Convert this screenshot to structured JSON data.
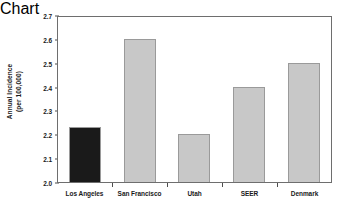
{
  "chart_data": {
    "type": "bar",
    "title": "",
    "xlabel": "",
    "ylabel": "Annual Incidence (per 100,000)",
    "ylabel_lines": [
      "Annual Incidence",
      "(per 100,000)"
    ],
    "categories": [
      "Los Angeles",
      "San Francisco",
      "Utah",
      "SEER",
      "Denmark"
    ],
    "values": [
      2.23,
      2.6,
      2.2,
      2.4,
      2.5
    ],
    "ylim": [
      2.0,
      2.7
    ],
    "ytick_values": [
      2.0,
      2.1,
      2.2,
      2.3,
      2.4,
      2.5,
      2.6,
      2.7
    ],
    "ytick_labels": [
      "2.0",
      "2.1",
      "2.2",
      "2.3",
      "2.4",
      "2.5",
      "2.6",
      "2.7"
    ],
    "grid": false,
    "legend": false,
    "bar_colors": [
      "#1a1a1a",
      "#c8c8c8",
      "#c8c8c8",
      "#c8c8c8",
      "#c8c8c8"
    ],
    "bar_edge_color": "#9a9a9a",
    "highlight_category": "Los Angeles"
  }
}
